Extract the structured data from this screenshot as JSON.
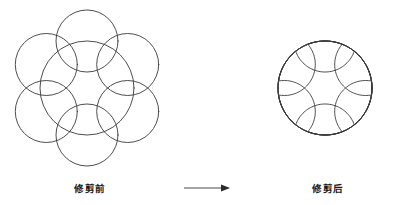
{
  "figure": {
    "stroke_color": "#3a3a3a",
    "background_color": "#ffffff",
    "arrow_color": "#2b2b2b"
  },
  "before": {
    "caption": "修剪前",
    "description": "One large circle with six overlapping small circles centered on its circumference",
    "big_circle": {
      "cx": 87,
      "cy": 88,
      "r": 47
    },
    "small_circle_radius": 31,
    "small_circle_count": 6,
    "small_circle_angles_deg": [
      90,
      150,
      210,
      270,
      330,
      30
    ],
    "small_circles": [
      {
        "cx": 87.0,
        "cy": 41.0
      },
      {
        "cx": 46.3,
        "cy": 64.5
      },
      {
        "cx": 46.3,
        "cy": 111.5
      },
      {
        "cx": 87.0,
        "cy": 135.0
      },
      {
        "cx": 127.7,
        "cy": 111.5
      },
      {
        "cx": 127.7,
        "cy": 64.5
      }
    ]
  },
  "after": {
    "caption": "修剪后",
    "description": "Resulting scalloped outline after trimming away the overlapping arc segments",
    "big_circle": {
      "cx": 87,
      "cy": 88,
      "r": 47
    },
    "small_circle_radius": 31,
    "small_circle_count": 6
  },
  "arrow": {
    "label": "transform-arrow",
    "direction": "right",
    "x1": 4,
    "x2": 50,
    "y": 18
  }
}
